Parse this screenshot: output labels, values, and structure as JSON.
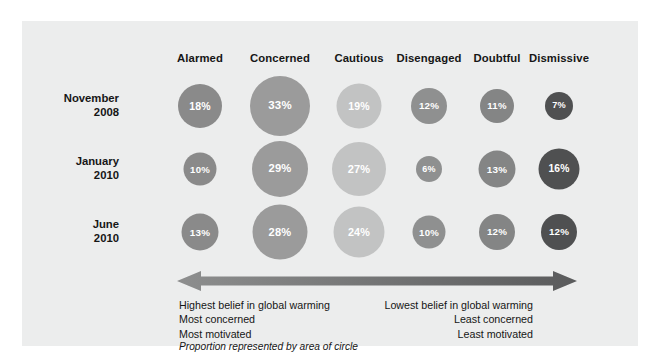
{
  "panel": {
    "background_color": "#eceded"
  },
  "chart_data": {
    "type": "bar",
    "title": "",
    "subtitle": "",
    "xlabel": "",
    "ylabel": "",
    "grid": false,
    "legend_position": "none",
    "note": "Bubble matrix: circle area proportional to percentage",
    "categories": [
      "Alarmed",
      "Concerned",
      "Cautious",
      "Disengaged",
      "Doubtful",
      "Dismissive"
    ],
    "category_colors": [
      "#8a8a8a",
      "#9b9b9b",
      "#c2c3c3",
      "#8f9090",
      "#848585",
      "#4f5051"
    ],
    "rows": [
      "November 2008",
      "January 2010",
      "June 2010"
    ],
    "series": [
      {
        "name": "November 2008",
        "values": [
          18,
          33,
          19,
          12,
          11,
          7
        ]
      },
      {
        "name": "January 2010",
        "values": [
          10,
          29,
          27,
          6,
          13,
          16
        ]
      },
      {
        "name": "June 2010",
        "values": [
          13,
          28,
          24,
          10,
          12,
          12
        ]
      }
    ],
    "value_labels": [
      [
        "18%",
        "33%",
        "19%",
        "12%",
        "11%",
        "7%"
      ],
      [
        "10%",
        "29%",
        "27%",
        "6%",
        "13%",
        "16%"
      ],
      [
        "13%",
        "28%",
        "24%",
        "10%",
        "12%",
        "12%"
      ]
    ],
    "ylim": [
      0,
      35
    ],
    "value_unit": "%"
  },
  "headers": [
    {
      "label": "Alarmed",
      "cx": 178
    },
    {
      "label": "Concerned",
      "cx": 258
    },
    {
      "label": "Cautious",
      "cx": 337
    },
    {
      "label": "Disengaged",
      "cx": 407
    },
    {
      "label": "Doubtful",
      "cx": 475
    },
    {
      "label": "Dismissive",
      "cx": 537
    }
  ],
  "rows": [
    {
      "line1": "November",
      "line2": "2008",
      "cy": 85
    },
    {
      "line1": "January",
      "line2": "2010",
      "cy": 148
    },
    {
      "line1": "June",
      "line2": "2010",
      "cy": 211
    }
  ],
  "bubbles": [
    {
      "value": "18%",
      "cx": 178,
      "cy": 85,
      "d": 44,
      "color": "#8a8a8a",
      "font": 10.5
    },
    {
      "value": "33%",
      "cx": 258,
      "cy": 85,
      "d": 60,
      "color": "#9b9b9b",
      "font": 11.5
    },
    {
      "value": "19%",
      "cx": 337,
      "cy": 85,
      "d": 45,
      "color": "#c2c3c3",
      "font": 10.5
    },
    {
      "value": "12%",
      "cx": 407,
      "cy": 85,
      "d": 36,
      "color": "#8f9090",
      "font": 9.8
    },
    {
      "value": "11%",
      "cx": 475,
      "cy": 85,
      "d": 34,
      "color": "#848585",
      "font": 9.6
    },
    {
      "value": "7%",
      "cx": 537,
      "cy": 85,
      "d": 28,
      "color": "#4f5051",
      "font": 9.2
    },
    {
      "value": "10%",
      "cx": 178,
      "cy": 148,
      "d": 33,
      "color": "#8a8a8a",
      "font": 9.6
    },
    {
      "value": "29%",
      "cx": 258,
      "cy": 148,
      "d": 56,
      "color": "#9b9b9b",
      "font": 11.2
    },
    {
      "value": "27%",
      "cx": 337,
      "cy": 148,
      "d": 54,
      "color": "#c2c3c3",
      "font": 11.0
    },
    {
      "value": "6%",
      "cx": 407,
      "cy": 148,
      "d": 26,
      "color": "#8f9090",
      "font": 9.0
    },
    {
      "value": "13%",
      "cx": 475,
      "cy": 148,
      "d": 37,
      "color": "#848585",
      "font": 9.9
    },
    {
      "value": "16%",
      "cx": 537,
      "cy": 148,
      "d": 41,
      "color": "#4f5051",
      "font": 10.3
    },
    {
      "value": "13%",
      "cx": 178,
      "cy": 211,
      "d": 37,
      "color": "#8a8a8a",
      "font": 9.9
    },
    {
      "value": "28%",
      "cx": 258,
      "cy": 211,
      "d": 55,
      "color": "#9b9b9b",
      "font": 11.1
    },
    {
      "value": "24%",
      "cx": 337,
      "cy": 211,
      "d": 51,
      "color": "#c2c3c3",
      "font": 10.8
    },
    {
      "value": "10%",
      "cx": 407,
      "cy": 211,
      "d": 33,
      "color": "#8f9090",
      "font": 9.6
    },
    {
      "value": "12%",
      "cx": 475,
      "cy": 211,
      "d": 36,
      "color": "#848585",
      "font": 9.8
    },
    {
      "value": "12%",
      "cx": 537,
      "cy": 211,
      "d": 36,
      "color": "#4f5051",
      "font": 9.8
    }
  ],
  "arrow": {
    "color_left": "#8d8e8e",
    "color_right": "#5a5b5c"
  },
  "captions": {
    "left": {
      "line1": "Highest belief in global warming",
      "line2": "Most concerned",
      "line3": "Most motivated"
    },
    "right": {
      "line1": "Lowest belief in global warming",
      "line2": "Least concerned",
      "line3": "Least motivated"
    },
    "note": "Proportion represented by area of circle"
  }
}
